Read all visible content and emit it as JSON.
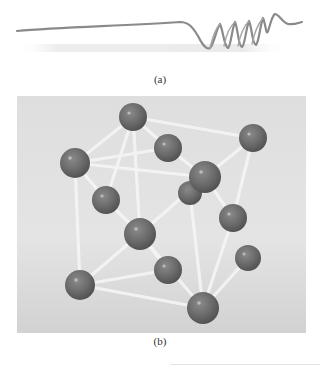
{
  "figure": {
    "subfigures": [
      {
        "id": "a",
        "caption": "(a)",
        "description": "wire with coiled spring section at right end",
        "colors": {
          "wire": "#8a8a8a",
          "shadow": "#e6e6e6",
          "background": "#ffffff"
        }
      },
      {
        "id": "b",
        "caption": "(b)",
        "description": "ball-and-stick crystal lattice model",
        "colors": {
          "ball": "#6b6b6b",
          "ball_highlight": "#b8b8b8",
          "stick": "#f3f3f3",
          "background": "#d9d9d9"
        }
      }
    ]
  }
}
